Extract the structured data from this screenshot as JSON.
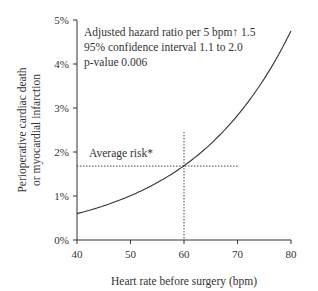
{
  "chart_data": {
    "type": "line",
    "title": "",
    "xlabel": "Heart rate before surgery (bpm)",
    "ylabel_line1": "Perioperative cardiac death",
    "ylabel_line2": "or myocardial infarction",
    "xlim": [
      40,
      80
    ],
    "ylim": [
      0,
      5
    ],
    "xticks": [
      40,
      50,
      60,
      70,
      80
    ],
    "yticks": [
      "0%",
      "1%",
      "2%",
      "3%",
      "4%",
      "5%"
    ],
    "series": [
      {
        "name": "Risk curve",
        "x": [
          40,
          45,
          50,
          55,
          60,
          65,
          70,
          75,
          80
        ],
        "values": [
          0.6,
          0.77,
          1.0,
          1.3,
          1.68,
          2.15,
          2.8,
          3.6,
          4.75
        ]
      }
    ],
    "reference_lines": {
      "average_risk_y": 1.68,
      "average_risk_x": 60
    },
    "annotations": {
      "stats_line1": "Adjusted hazard ratio per 5 bpm↑ 1.5",
      "stats_line2": "95% confidence interval 1.1 to 2.0",
      "stats_line3": "p-value 0.006",
      "average_risk_label": "Average risk*"
    },
    "grid": false,
    "legend": null
  }
}
